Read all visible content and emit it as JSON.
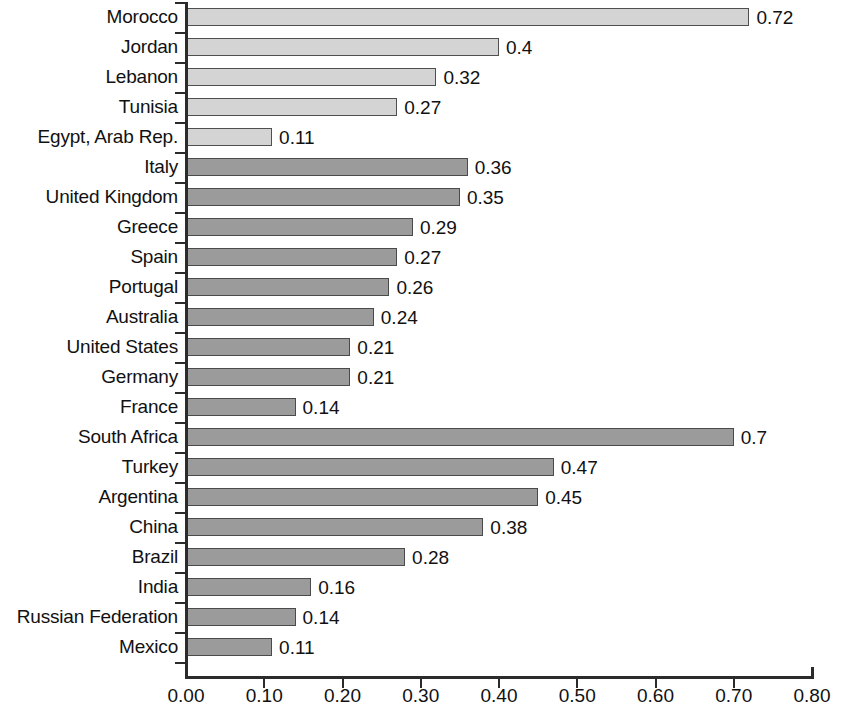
{
  "chart_data": {
    "type": "bar",
    "orientation": "horizontal",
    "title": "",
    "subtitle": "",
    "xlabel": "",
    "ylabel": "",
    "xlim": [
      0.0,
      0.8
    ],
    "xticks": [
      0.0,
      0.1,
      0.2,
      0.3,
      0.4,
      0.5,
      0.6,
      0.7,
      0.8
    ],
    "xtick_labels": [
      "0.00",
      "0.10",
      "0.20",
      "0.30",
      "0.40",
      "0.50",
      "0.60",
      "0.70",
      "0.80"
    ],
    "grid": false,
    "legend": null,
    "categories": [
      "Morocco",
      "Jordan",
      "Lebanon",
      "Tunisia",
      "Egypt, Arab Rep.",
      "Italy",
      "United Kingdom",
      "Greece",
      "Spain",
      "Portugal",
      "Australia",
      "United States",
      "Germany",
      "France",
      "South Africa",
      "Turkey",
      "Argentina",
      "China",
      "Brazil",
      "India",
      "Russian Federation",
      "Mexico"
    ],
    "values": [
      0.72,
      0.4,
      0.32,
      0.27,
      0.11,
      0.36,
      0.35,
      0.29,
      0.27,
      0.26,
      0.24,
      0.21,
      0.21,
      0.14,
      0.7,
      0.47,
      0.45,
      0.38,
      0.28,
      0.16,
      0.14,
      0.11
    ],
    "value_labels": [
      "0.72",
      "0.4",
      "0.32",
      "0.27",
      "0.11",
      "0.36",
      "0.35",
      "0.29",
      "0.27",
      "0.26",
      "0.24",
      "0.21",
      "0.21",
      "0.14",
      "0.7",
      "0.47",
      "0.45",
      "0.38",
      "0.28",
      "0.16",
      "0.14",
      "0.11"
    ],
    "bar_styles": [
      "light",
      "light",
      "light",
      "light",
      "light",
      "dark",
      "dark",
      "dark",
      "dark",
      "dark",
      "dark",
      "dark",
      "dark",
      "dark",
      "dark",
      "dark",
      "dark",
      "dark",
      "dark",
      "dark",
      "dark",
      "dark"
    ],
    "colors": {
      "bar_light": "#d4d4d4",
      "bar_dark": "#9b9b9b",
      "bar_border": "#4a4a4a",
      "axis": "#2b2b2b",
      "text": "#111111",
      "background": "#ffffff"
    }
  }
}
